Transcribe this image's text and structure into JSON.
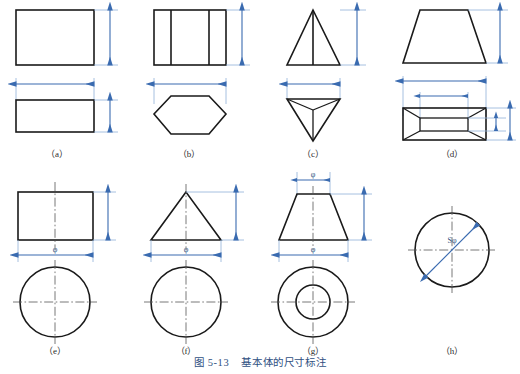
{
  "figure": {
    "caption_number": "图 5-13",
    "caption_title": "基本体的尺寸标注",
    "caption_full": "图 5-13  基本体的尺寸标注",
    "caption_color": "#2f4f7f",
    "line_color": "#1a1a1a",
    "dimension_color": "#3a6bb0",
    "centerline_color": "#555555",
    "background": "#ffffff"
  },
  "panels": [
    {
      "id": "a",
      "label": "（a）",
      "solid": "rectangular-prism",
      "front_view": "rectangle",
      "top_view": "rectangle",
      "dimensions": [
        "height",
        "width"
      ],
      "dim_labels": [
        "",
        ""
      ]
    },
    {
      "id": "b",
      "label": "（b）",
      "solid": "hexagonal-prism",
      "front_view": "rectangle-with-two-vertical-edges",
      "top_view": "hexagon",
      "dimensions": [
        "height",
        "width"
      ],
      "dim_labels": [
        "",
        ""
      ]
    },
    {
      "id": "c",
      "label": "（c）",
      "solid": "triangular-pyramid",
      "front_view": "triangle-with-center-edge",
      "top_view": "inverted-triangle-with-radial-edges",
      "dimensions": [
        "height",
        "width"
      ],
      "dim_labels": [
        "",
        ""
      ]
    },
    {
      "id": "d",
      "label": "（d）",
      "solid": "truncated-rectangular-pyramid",
      "front_view": "trapezoid",
      "top_view": "nested-rectangles-with-diagonals",
      "dimensions": [
        "height",
        "bottom-width",
        "top-width",
        "bottom-depth",
        "top-depth"
      ],
      "dim_labels": [
        "",
        "",
        "",
        "",
        ""
      ]
    },
    {
      "id": "e",
      "label": "（e）",
      "solid": "cylinder",
      "front_view": "rectangle-with-vertical-centerline",
      "top_view": "circle-with-crosshair-centerlines",
      "dimensions": [
        "height",
        "diameter"
      ],
      "dim_labels": [
        "",
        "φ"
      ]
    },
    {
      "id": "f",
      "label": "（f）",
      "solid": "cone",
      "front_view": "triangle-with-vertical-centerline",
      "top_view": "circle-with-crosshair-centerlines",
      "dimensions": [
        "height",
        "diameter"
      ],
      "dim_labels": [
        "",
        "φ"
      ]
    },
    {
      "id": "g",
      "label": "（g）",
      "solid": "truncated-cone",
      "front_view": "trapezoid-with-vertical-centerline",
      "top_view": "concentric-circles-with-crosshair-centerlines",
      "dimensions": [
        "top-diameter",
        "height",
        "bottom-diameter"
      ],
      "dim_labels": [
        "φ",
        "",
        "φ"
      ]
    },
    {
      "id": "h",
      "label": "（h）",
      "solid": "sphere",
      "front_view": "circle-with-crosshair-centerlines",
      "top_view": "",
      "dimensions": [
        "spherical-diameter"
      ],
      "dim_labels": [
        "Sφ"
      ]
    }
  ],
  "symbols": {
    "phi": "φ",
    "s_phi": "Sφ"
  }
}
